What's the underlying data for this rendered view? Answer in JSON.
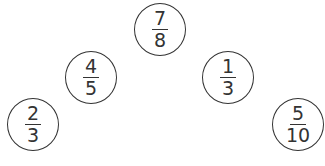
{
  "fractions": [
    {
      "id": "seven-eighths",
      "numerator": "7",
      "denominator": "8",
      "cx": 160,
      "cy": 30
    },
    {
      "id": "four-fifths",
      "numerator": "4",
      "denominator": "5",
      "cx": 91,
      "cy": 77
    },
    {
      "id": "one-third",
      "numerator": "1",
      "denominator": "3",
      "cx": 228,
      "cy": 77
    },
    {
      "id": "two-thirds",
      "numerator": "2",
      "denominator": "3",
      "cx": 34,
      "cy": 125
    },
    {
      "id": "five-tenths",
      "numerator": "5",
      "denominator": "10",
      "cx": 298,
      "cy": 125
    }
  ]
}
